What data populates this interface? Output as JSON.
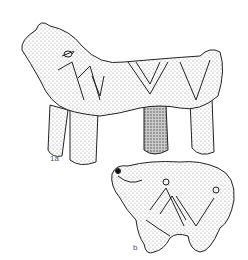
{
  "figures": [
    {
      "id": "1a",
      "label": "1a",
      "subject": "animal-figurine-side-view"
    },
    {
      "id": "b",
      "label": "b",
      "subject": "animal-figurine-three-quarter-view"
    }
  ],
  "colors": {
    "background": "#ffffff",
    "ink": "#222222",
    "stipple": "#777777"
  }
}
